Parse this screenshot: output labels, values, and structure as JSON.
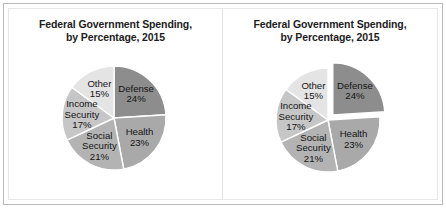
{
  "figure": {
    "background": "#ffffff",
    "frame_color": "#b9b9b9",
    "divider_color": "#e2e2e2"
  },
  "chart_data": [
    {
      "id": "left",
      "type": "pie",
      "title": "Federal Government Spending,",
      "subtitle": "by Percentage, 2015",
      "exploded": false,
      "exploded_slice": null,
      "labels": [
        "Defense",
        "Health",
        "Social Security",
        "Income Security",
        "Other"
      ],
      "values": [
        24,
        23,
        21,
        17,
        15
      ],
      "value_labels": [
        "24%",
        "23%",
        "21%",
        "17%",
        "15%"
      ],
      "colors": [
        "#8d8d8d",
        "#a9a9a9",
        "#b3b3b3",
        "#c6c6c6",
        "#e4e4e4"
      ],
      "start_angle_deg": 0,
      "units": "percent",
      "legend": "none",
      "xlabel": "",
      "ylabel": ""
    },
    {
      "id": "right",
      "type": "pie",
      "title": "Federal Government Spending,",
      "subtitle": "by Percentage, 2015",
      "exploded": true,
      "exploded_slice": "Defense",
      "labels": [
        "Defense",
        "Health",
        "Social Security",
        "Income Security",
        "Other"
      ],
      "values": [
        24,
        23,
        21,
        17,
        15
      ],
      "value_labels": [
        "24%",
        "23%",
        "21%",
        "17%",
        "15%"
      ],
      "colors": [
        "#8d8d8d",
        "#a9a9a9",
        "#b3b3b3",
        "#c6c6c6",
        "#e4e4e4"
      ],
      "start_angle_deg": 0,
      "units": "percent",
      "legend": "none",
      "xlabel": "",
      "ylabel": ""
    }
  ],
  "charts": {
    "left": {
      "title_line1": "Federal Government Spending,",
      "title_line2": "by Percentage, 2015",
      "slices": [
        {
          "name": "Defense",
          "label": "Defense",
          "label2": "",
          "value": "24%"
        },
        {
          "name": "Health",
          "label": "Health",
          "label2": "",
          "value": "23%"
        },
        {
          "name": "Social Security",
          "label": "Social",
          "label2": "Security",
          "value": "21%"
        },
        {
          "name": "Income Security",
          "label": "Income",
          "label2": "Security",
          "value": "17%"
        },
        {
          "name": "Other",
          "label": "Other",
          "label2": "",
          "value": "15%"
        }
      ]
    },
    "right": {
      "title_line1": "Federal Government Spending,",
      "title_line2": "by Percentage, 2015",
      "slices": [
        {
          "name": "Defense",
          "label": "Defense",
          "label2": "",
          "value": "24%"
        },
        {
          "name": "Health",
          "label": "Health",
          "label2": "",
          "value": "23%"
        },
        {
          "name": "Social Security",
          "label": "Social",
          "label2": "Security",
          "value": "21%"
        },
        {
          "name": "Income Security",
          "label": "Income",
          "label2": "Security",
          "value": "17%"
        },
        {
          "name": "Other",
          "label": "Other",
          "label2": "",
          "value": "15%"
        }
      ]
    }
  }
}
